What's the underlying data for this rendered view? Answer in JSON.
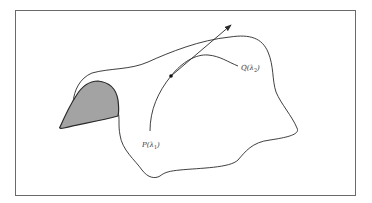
{
  "figure": {
    "type": "diagram",
    "labels": {
      "p_label": "P(λ",
      "p_sub": "1",
      "q_label": "Q(λ",
      "q_sub": "2",
      "close": ")"
    },
    "colors": {
      "stroke": "#2a2a2a",
      "shaded": "#a3a3a3",
      "frame": "#6a6a6a"
    }
  }
}
